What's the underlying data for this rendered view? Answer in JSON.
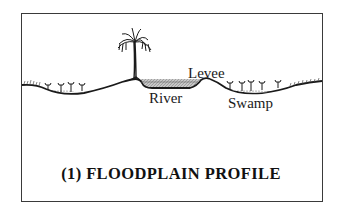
{
  "figure": {
    "caption": "(1) FLOODPLAIN PROFILE",
    "labels": {
      "levee": "Levee",
      "river": "River",
      "swamp": "Swamp"
    },
    "elements": [
      "ground-profile-line",
      "left-swamp-basin",
      "left-swamp-plants",
      "tree-on-bank",
      "river-channel",
      "levee-ridge",
      "right-swamp-basin",
      "right-swamp-plants",
      "grass-tufts"
    ],
    "colors": {
      "line": "#1a1a1a",
      "river_fill": "#b8b8b8",
      "frame": "#3a3a3a",
      "background": "#ffffff"
    }
  }
}
